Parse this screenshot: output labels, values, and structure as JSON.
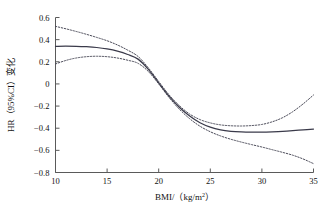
{
  "chart_data": {
    "type": "line",
    "title": "",
    "subtitle": "",
    "xlabel": "BMI/（kg/m",
    "xlabel_sup": "2",
    "xlabel_tail": "）",
    "ylabel": "HR（95%CI）变化",
    "xlim": [
      10,
      35
    ],
    "ylim": [
      -0.8,
      0.6
    ],
    "grid": false,
    "legend": "none",
    "x_ticks": [
      10,
      15,
      20,
      25,
      30,
      35
    ],
    "x_tick_labels": [
      "10",
      "15",
      "20",
      "25",
      "30",
      "35"
    ],
    "y_ticks": [
      0.6,
      0.4,
      0.2,
      0,
      -0.2,
      -0.4,
      -0.6,
      -0.8
    ],
    "y_tick_labels": [
      "0.6",
      "0.4",
      "0.2",
      "0",
      "−0.2",
      "−0.4",
      "−0.6",
      "−0.8"
    ],
    "x": [
      10,
      11,
      12,
      13,
      14,
      15,
      16,
      17,
      18,
      19,
      20,
      21,
      22,
      23,
      24,
      25,
      26,
      27,
      28,
      29,
      30,
      31,
      32,
      33,
      34,
      35
    ],
    "series": [
      {
        "name": "HR estimate",
        "style": "solid",
        "color": "#3a3a4a",
        "values": [
          0.34,
          0.341,
          0.34,
          0.336,
          0.329,
          0.316,
          0.296,
          0.266,
          0.224,
          0.132,
          0.01,
          -0.11,
          -0.21,
          -0.29,
          -0.35,
          -0.39,
          -0.415,
          -0.428,
          -0.434,
          -0.436,
          -0.435,
          -0.432,
          -0.428,
          -0.422,
          -0.415,
          -0.408
        ]
      },
      {
        "name": "Upper 95% CI",
        "style": "dotted",
        "color": "#4a4a58",
        "values": [
          0.52,
          0.498,
          0.474,
          0.448,
          0.42,
          0.39,
          0.352,
          0.305,
          0.248,
          0.145,
          0.022,
          -0.098,
          -0.196,
          -0.272,
          -0.322,
          -0.352,
          -0.37,
          -0.378,
          -0.38,
          -0.376,
          -0.366,
          -0.342,
          -0.305,
          -0.25,
          -0.18,
          -0.1
        ]
      },
      {
        "name": "Lower 95% CI",
        "style": "dotted",
        "color": "#4a4a58",
        "values": [
          0.18,
          0.212,
          0.234,
          0.246,
          0.25,
          0.246,
          0.234,
          0.214,
          0.186,
          0.112,
          0.0,
          -0.122,
          -0.228,
          -0.314,
          -0.382,
          -0.432,
          -0.47,
          -0.5,
          -0.525,
          -0.548,
          -0.57,
          -0.594,
          -0.618,
          -0.644,
          -0.678,
          -0.72
        ]
      }
    ]
  }
}
